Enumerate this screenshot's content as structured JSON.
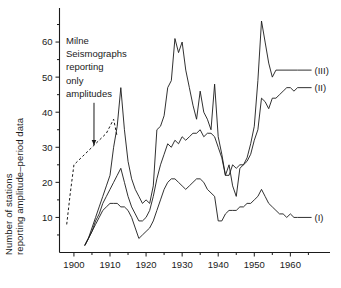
{
  "chart_data": {
    "type": "line",
    "title": "",
    "xlabel": "",
    "ylabel_line1": "Number of stations",
    "ylabel_line2": "reporting amplitude–period data",
    "xlim": [
      1896,
      1966
    ],
    "ylim": [
      0,
      68
    ],
    "xticks": [
      1900,
      1910,
      1920,
      1930,
      1940,
      1950,
      1960
    ],
    "xtick_labels": [
      "1900",
      "1910",
      "1920",
      "1930",
      "1940",
      "1950",
      "1960"
    ],
    "xminor_ticks": [
      1905,
      1915,
      1925,
      1935,
      1945,
      1955,
      1965
    ],
    "yticks": [
      10,
      20,
      30,
      40,
      50,
      60
    ],
    "ytick_labels": [
      "10",
      "20",
      "30",
      "40",
      "50",
      "60"
    ],
    "grid": false,
    "legend_position": "right-end-of-line",
    "annotations": [
      {
        "name": "milne-annotation",
        "lines": [
          "Milne",
          "Seismographs",
          "reporting",
          "only",
          "amplitudes"
        ],
        "points_to_year": 1905,
        "points_to_value": 30
      }
    ],
    "series": [
      {
        "name": "(III)",
        "label": "(III)",
        "style": "solid",
        "end_label_value": 52,
        "x": [
          1903,
          1904,
          1905,
          1906,
          1907,
          1908,
          1909,
          1910,
          1911,
          1912,
          1913,
          1914,
          1915,
          1916,
          1917,
          1918,
          1919,
          1920,
          1921,
          1922,
          1923,
          1924,
          1925,
          1926,
          1927,
          1928,
          1929,
          1930,
          1931,
          1932,
          1933,
          1934,
          1935,
          1936,
          1937,
          1938,
          1939,
          1940,
          1941,
          1942,
          1943,
          1944,
          1945,
          1946,
          1947,
          1948,
          1949,
          1950,
          1951,
          1952,
          1953,
          1954,
          1955,
          1956,
          1962
        ],
        "values": [
          2,
          4,
          7,
          10,
          13,
          16,
          19,
          22,
          30,
          36,
          47,
          35,
          26,
          21,
          18,
          16,
          14,
          15,
          14,
          19,
          35,
          36,
          39,
          47,
          49,
          61,
          57,
          60,
          52,
          47,
          42,
          38,
          46,
          40,
          38,
          35,
          48,
          33,
          28,
          22,
          25,
          19,
          16,
          24,
          25,
          27,
          31,
          36,
          49,
          66,
          60,
          54,
          50,
          52,
          52
        ]
      },
      {
        "name": "(II)",
        "label": "(II)",
        "style": "solid",
        "end_label_value": 47,
        "x": [
          1903,
          1904,
          1905,
          1906,
          1907,
          1908,
          1909,
          1910,
          1911,
          1912,
          1913,
          1914,
          1915,
          1916,
          1917,
          1918,
          1919,
          1920,
          1921,
          1922,
          1923,
          1924,
          1925,
          1926,
          1927,
          1928,
          1929,
          1930,
          1931,
          1932,
          1933,
          1934,
          1935,
          1936,
          1937,
          1938,
          1939,
          1940,
          1941,
          1942,
          1943,
          1944,
          1945,
          1946,
          1947,
          1948,
          1949,
          1950,
          1951,
          1952,
          1953,
          1954,
          1955,
          1956,
          1957,
          1958,
          1959,
          1960,
          1961,
          1962
        ],
        "values": [
          2,
          4,
          6,
          9,
          11,
          14,
          16,
          18,
          20,
          22,
          24,
          20,
          16,
          13,
          11,
          9,
          9,
          10,
          12,
          16,
          21,
          25,
          28,
          31,
          30,
          32,
          31,
          33,
          32,
          33,
          34,
          34,
          35,
          33,
          34,
          34,
          33,
          30,
          27,
          22,
          22,
          25,
          24,
          25,
          25,
          26,
          28,
          32,
          35,
          44,
          43,
          41,
          44,
          44,
          45,
          46,
          47,
          47,
          46,
          47
        ]
      },
      {
        "name": "(I)",
        "label": "(I)",
        "style": "solid",
        "end_label_value": 10,
        "x": [
          1903,
          1904,
          1905,
          1906,
          1907,
          1908,
          1909,
          1910,
          1911,
          1912,
          1913,
          1914,
          1915,
          1916,
          1917,
          1918,
          1919,
          1920,
          1921,
          1922,
          1923,
          1924,
          1925,
          1926,
          1927,
          1928,
          1929,
          1930,
          1931,
          1932,
          1933,
          1934,
          1935,
          1936,
          1937,
          1938,
          1939,
          1940,
          1941,
          1942,
          1943,
          1944,
          1945,
          1946,
          1947,
          1948,
          1949,
          1950,
          1951,
          1952,
          1953,
          1954,
          1955,
          1956,
          1957,
          1958,
          1959,
          1960,
          1961,
          1962
        ],
        "values": [
          2,
          4,
          6,
          8,
          10,
          12,
          13,
          14,
          14,
          14,
          13,
          13,
          12,
          10,
          7,
          4,
          5,
          6,
          7,
          9,
          12,
          15,
          18,
          20,
          21,
          21,
          20,
          19,
          18,
          19,
          20,
          21,
          21,
          20,
          18,
          17,
          16,
          9,
          9,
          11,
          12,
          12,
          12,
          13,
          13,
          14,
          14,
          15,
          16,
          18,
          16,
          14,
          13,
          12,
          11,
          11,
          10,
          11,
          10,
          10
        ]
      },
      {
        "name": "milne-dashed",
        "label": "",
        "style": "dashed",
        "x": [
          1898,
          1899,
          1900,
          1901,
          1902,
          1903,
          1904,
          1905,
          1906,
          1907,
          1908,
          1909,
          1910,
          1911,
          1912
        ],
        "values": [
          8,
          17,
          25,
          26,
          27,
          28,
          29,
          30,
          31,
          32,
          33,
          34,
          36,
          38,
          33
        ]
      }
    ]
  }
}
